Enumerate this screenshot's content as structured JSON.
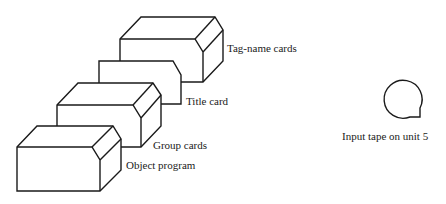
{
  "diagram": {
    "type": "input-deck-illustration",
    "card_decks": [
      {
        "id": "tag-name",
        "label": "Tag-name cards"
      },
      {
        "id": "title",
        "label": "Title card"
      },
      {
        "id": "group",
        "label": "Group cards"
      },
      {
        "id": "object",
        "label": "Object program"
      }
    ],
    "tape": {
      "label": "Input tape on unit 5"
    }
  }
}
